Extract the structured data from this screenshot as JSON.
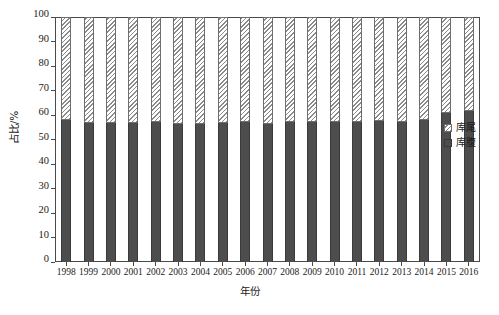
{
  "chart_data": {
    "type": "bar",
    "subtype": "100% stacked bar",
    "title": "",
    "xlabel": "年份",
    "ylabel": "占比/%",
    "ylim": [
      0,
      100
    ],
    "yticks": [
      0,
      10,
      20,
      30,
      40,
      50,
      60,
      70,
      80,
      90,
      100
    ],
    "ytick_labels": [
      "0",
      "10",
      "20",
      "30",
      "40",
      "50",
      "60",
      "70",
      "80",
      "90",
      "100"
    ],
    "grid": false,
    "legend_position": "right",
    "categories": [
      "1998",
      "1999",
      "2000",
      "2001",
      "2002",
      "2003",
      "2004",
      "2005",
      "2006",
      "2007",
      "2008",
      "2009",
      "2010",
      "2011",
      "2012",
      "2013",
      "2014",
      "2015",
      "2016"
    ],
    "series": [
      {
        "name": "库腹",
        "fill": "solid",
        "color": "#4d4d4d",
        "values": [
          57.8,
          56.8,
          56.7,
          56.8,
          57.0,
          56.5,
          56.2,
          56.6,
          57.0,
          56.5,
          57.2,
          57.3,
          57.0,
          57.2,
          57.5,
          57.3,
          57.8,
          61.0,
          61.5
        ]
      },
      {
        "name": "库尾",
        "fill": "hatched",
        "color": "#8a8a8a",
        "values": [
          42.2,
          43.2,
          43.3,
          43.2,
          43.0,
          43.5,
          43.8,
          43.4,
          43.0,
          43.5,
          42.8,
          42.7,
          43.0,
          42.8,
          42.5,
          42.7,
          42.2,
          39.0,
          38.5
        ]
      }
    ]
  },
  "legend": {
    "items": [
      {
        "label": "库尾",
        "pattern": "hatched"
      },
      {
        "label": "库腹",
        "pattern": "solid"
      }
    ]
  },
  "axes": {
    "x_title": "年份",
    "y_title": "占比/%"
  },
  "caption": ""
}
